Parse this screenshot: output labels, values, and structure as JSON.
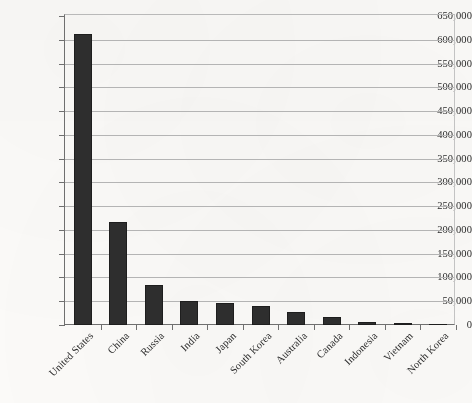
{
  "chart_data": {
    "type": "bar",
    "title": "",
    "subtitle": "",
    "xlabel": "",
    "ylabel": "",
    "categories": [
      "United States",
      "China",
      "Russia",
      "India",
      "Japan",
      "South Korea",
      "Australia",
      "Canada",
      "Indonesia",
      "Vietnam",
      "North Korea"
    ],
    "values": [
      612000,
      217000,
      85000,
      51000,
      46000,
      39000,
      27000,
      17000,
      7000,
      5000,
      1500
    ],
    "series": [
      {
        "name": "",
        "values": [
          612000,
          217000,
          85000,
          51000,
          46000,
          39000,
          27000,
          17000,
          7000,
          5000,
          1500
        ]
      }
    ],
    "ylim": [
      0,
      650000
    ],
    "ytick_step": 50000,
    "ytick_labels": [
      "0",
      "50,000",
      "100,000",
      "150,000",
      "200,000",
      "250,000",
      "300,000",
      "350,000",
      "400,000",
      "450,000",
      "500,000",
      "550,000",
      "600,000",
      "650,000"
    ],
    "ytick_values": [
      0,
      50000,
      100000,
      150000,
      200000,
      250000,
      300000,
      350000,
      400000,
      450000,
      500000,
      550000,
      600000,
      650000
    ],
    "grid": "horizontal",
    "legend": "none",
    "bar_color": "#2e2e2e",
    "gridline_color": "#b4b4b4",
    "axis_color": "#6f6f6f",
    "background_color": "#fbfaf8",
    "xlabel_rotation": -45
  }
}
